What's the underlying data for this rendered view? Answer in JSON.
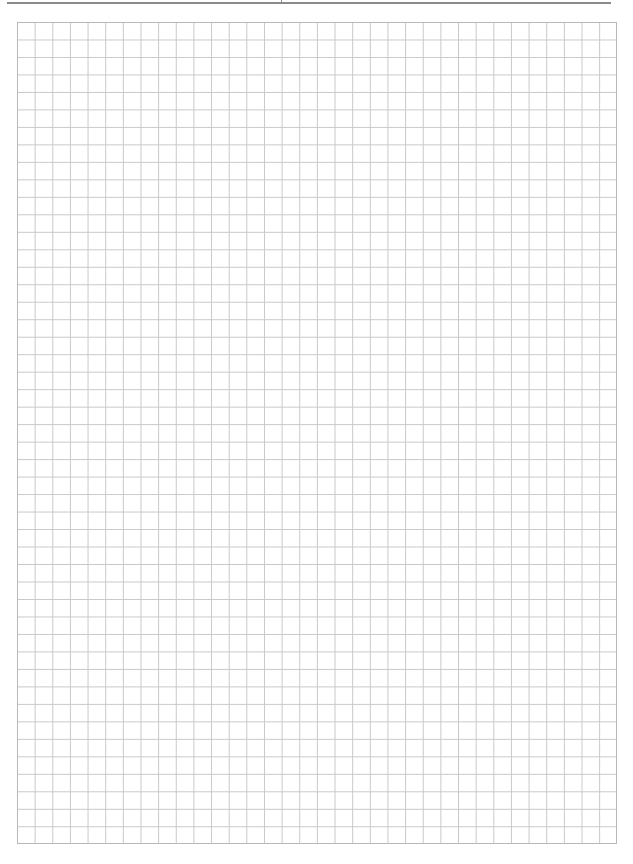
{
  "page": {
    "type": "grid-paper",
    "header_rule": true,
    "grid": {
      "columns": 34,
      "rows": 47,
      "line_color": "#c8c8c8",
      "border_color": "#b8b8b8"
    }
  }
}
